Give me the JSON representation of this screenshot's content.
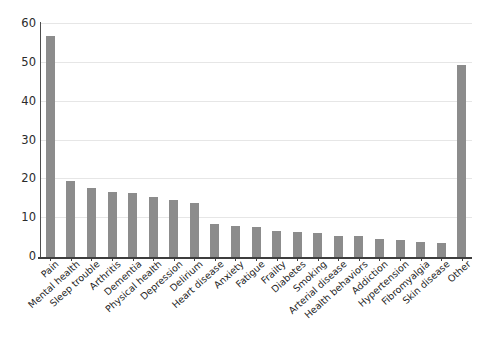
{
  "chart_data": {
    "type": "bar",
    "title": "",
    "subtitle": "",
    "xlabel": "",
    "ylabel": "",
    "ylim": [
      0,
      60
    ],
    "yticks": [
      0,
      10,
      20,
      30,
      40,
      50,
      60
    ],
    "grid": true,
    "legend": null,
    "bar_color": "#8c8c8c",
    "axis_color": "#3d3d3d",
    "grid_color": "#e6e6e6",
    "categories": [
      "Pain",
      "Mental health",
      "Sleep trouble",
      "Arthritis",
      "Dementia",
      "Physical health",
      "Depression",
      "Delirium",
      "Heart disease",
      "Anxiety",
      "Fatigue",
      "Frailty",
      "Diabetes",
      "Smoking",
      "Arterial disease",
      "Health behaviors",
      "Addiction",
      "Hypertension",
      "Fibromyalgia",
      "Skin disease",
      "Other"
    ],
    "values": [
      57.0,
      19.7,
      17.8,
      16.8,
      16.6,
      15.5,
      14.8,
      13.9,
      8.5,
      7.9,
      7.8,
      6.8,
      6.5,
      6.2,
      5.5,
      5.3,
      4.6,
      4.3,
      3.8,
      3.7,
      49.5
    ]
  }
}
